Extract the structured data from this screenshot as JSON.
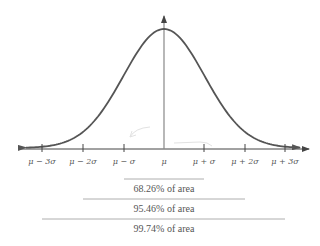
{
  "chart_data": {
    "type": "line",
    "title": "",
    "xlabel": "",
    "ylabel": "",
    "x_tick_labels": [
      "μ − 3σ",
      "μ − 2σ",
      "μ − σ",
      "μ",
      "μ + σ",
      "μ + 2σ",
      "μ + 3σ"
    ],
    "x_ticks_sigma": [
      -3,
      -2,
      -1,
      0,
      1,
      2,
      3
    ],
    "grid": false,
    "legend": null,
    "intervals": [
      {
        "from_sigma": -1,
        "to_sigma": 1,
        "percent": 68.26,
        "label": "68.26% of area"
      },
      {
        "from_sigma": -2,
        "to_sigma": 2,
        "percent": 95.46,
        "label": "95.46% of area"
      },
      {
        "from_sigma": -3,
        "to_sigma": 3,
        "percent": 99.74,
        "label": "99.74% of area"
      }
    ]
  },
  "axis": {
    "ticks": [
      {
        "label": "μ − 3σ",
        "x": 42
      },
      {
        "label": "μ − 2σ",
        "x": 83
      },
      {
        "label": "μ − σ",
        "x": 124
      },
      {
        "label": "μ",
        "x": 164
      },
      {
        "label": "μ + σ",
        "x": 204
      },
      {
        "label": "μ + 2σ",
        "x": 245
      },
      {
        "label": "μ + 3σ",
        "x": 285
      }
    ]
  },
  "areas": [
    {
      "label": "68.26% of area"
    },
    {
      "label": "95.46% of area"
    },
    {
      "label": "99.74% of area"
    }
  ],
  "colors": {
    "curve": "#555555",
    "axis": "#444444",
    "center_line": "#888888",
    "bracket": "#999999",
    "text": "#555555"
  }
}
